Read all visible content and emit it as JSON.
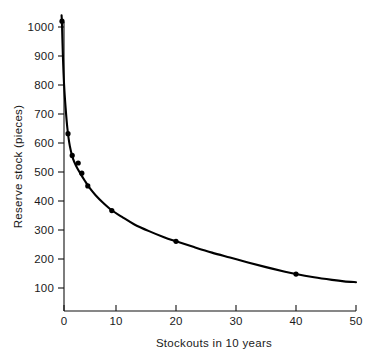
{
  "chart_data": {
    "type": "line",
    "title": "",
    "subtitle": "",
    "xlabel": "Stockouts in 10 years",
    "ylabel": "Reserve stock  (pieces)",
    "xlim": [
      0,
      50
    ],
    "ylim": [
      20,
      1040
    ],
    "grid": false,
    "legend": null,
    "x_ticks": [
      0,
      10,
      20,
      30,
      40,
      50
    ],
    "x_tick_labels": [
      "0",
      "10",
      "20",
      "30",
      "40",
      "50"
    ],
    "y_ticks": [
      100,
      200,
      300,
      400,
      500,
      600,
      700,
      800,
      900,
      1000
    ],
    "y_tick_labels": [
      "100",
      "200",
      "300",
      "400",
      "500",
      "600",
      "700",
      "800",
      "900",
      "1000"
    ],
    "x_minor_ticks": [
      5,
      15,
      25,
      35,
      45
    ],
    "series": [
      {
        "name": "Reserve stock vs stockouts",
        "marker": "filled-circle",
        "line_style": "solid",
        "color": "#000000",
        "points": [
          {
            "x": 1.0,
            "y": 1020
          },
          {
            "x": 2.0,
            "y": 632
          },
          {
            "x": 2.7,
            "y": 557
          },
          {
            "x": 3.7,
            "y": 531
          },
          {
            "x": 4.3,
            "y": 496
          },
          {
            "x": 5.3,
            "y": 452
          },
          {
            "x": 9.3,
            "y": 367
          },
          {
            "x": 20.0,
            "y": 261
          },
          {
            "x": 40.0,
            "y": 148
          }
        ]
      }
    ],
    "curve": [
      {
        "x": 0.93,
        "y": 1040
      },
      {
        "x": 1.0,
        "y": 1010
      },
      {
        "x": 1.15,
        "y": 900
      },
      {
        "x": 1.35,
        "y": 800
      },
      {
        "x": 1.6,
        "y": 722
      },
      {
        "x": 1.9,
        "y": 650
      },
      {
        "x": 2.3,
        "y": 590
      },
      {
        "x": 2.8,
        "y": 548
      },
      {
        "x": 3.4,
        "y": 519
      },
      {
        "x": 4.0,
        "y": 497
      },
      {
        "x": 4.8,
        "y": 470
      },
      {
        "x": 5.6,
        "y": 445
      },
      {
        "x": 6.6,
        "y": 420
      },
      {
        "x": 7.8,
        "y": 395
      },
      {
        "x": 9.3,
        "y": 368
      },
      {
        "x": 11.0,
        "y": 345
      },
      {
        "x": 13.0,
        "y": 320
      },
      {
        "x": 15.5,
        "y": 296
      },
      {
        "x": 18.0,
        "y": 275
      },
      {
        "x": 20.0,
        "y": 261
      },
      {
        "x": 23.0,
        "y": 241
      },
      {
        "x": 26.0,
        "y": 222
      },
      {
        "x": 29.0,
        "y": 205
      },
      {
        "x": 32.0,
        "y": 188
      },
      {
        "x": 35.0,
        "y": 172
      },
      {
        "x": 38.0,
        "y": 157
      },
      {
        "x": 40.0,
        "y": 148
      },
      {
        "x": 43.0,
        "y": 137
      },
      {
        "x": 46.0,
        "y": 128
      },
      {
        "x": 48.0,
        "y": 123
      },
      {
        "x": 50.0,
        "y": 120
      }
    ]
  },
  "figure": {
    "background_color": "#ffffff",
    "foreground_color": "#000000"
  }
}
